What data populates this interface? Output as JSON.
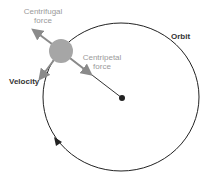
{
  "labels": {
    "centrifugal": "Centrifugal force",
    "centripetal": "Centripetal force",
    "velocity": "Velocity",
    "orbit": "Orbit"
  },
  "colors": {
    "orbit": "#222222",
    "object": "#a6a6a6",
    "arrow": "#8a8a8a",
    "label_light": "#9a9a9a",
    "label_dark": "#333333"
  }
}
